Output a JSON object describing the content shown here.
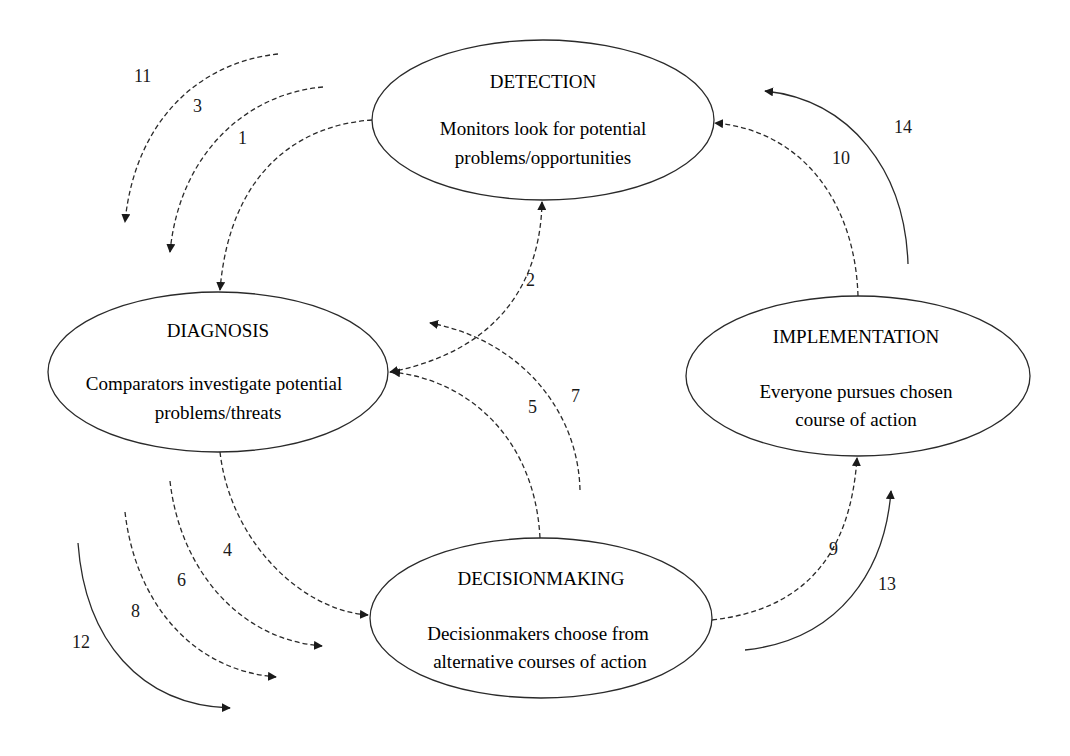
{
  "diagram": {
    "nodes": [
      {
        "id": "detection",
        "title": "DETECTION",
        "desc_line1": "Monitors look for potential",
        "desc_line2": "problems/opportunities"
      },
      {
        "id": "diagnosis",
        "title": "DIAGNOSIS",
        "desc_line1": "Comparators investigate potential",
        "desc_line2": "problems/threats"
      },
      {
        "id": "implementation",
        "title": "IMPLEMENTATION",
        "desc_line1": "Everyone pursues chosen",
        "desc_line2": "course of action"
      },
      {
        "id": "decisionmaking",
        "title": "DECISIONMAKING",
        "desc_line1": "Decisionmakers choose from",
        "desc_line2": "alternative courses of action"
      }
    ],
    "edges": [
      {
        "label": "1",
        "from": "detection",
        "to": "diagnosis",
        "style": "dashed"
      },
      {
        "label": "2",
        "from": "diagnosis",
        "to": "detection",
        "style": "dashed",
        "bidirectional": true
      },
      {
        "label": "3",
        "style": "dashed"
      },
      {
        "label": "4",
        "from": "diagnosis",
        "to": "decisionmaking",
        "style": "dashed"
      },
      {
        "label": "5",
        "from": "decisionmaking",
        "to": "diagnosis",
        "style": "dashed"
      },
      {
        "label": "6",
        "style": "dashed"
      },
      {
        "label": "7",
        "style": "dashed"
      },
      {
        "label": "8",
        "style": "dashed"
      },
      {
        "label": "9",
        "from": "decisionmaking",
        "to": "implementation",
        "style": "dashed"
      },
      {
        "label": "10",
        "from": "implementation",
        "to": "detection",
        "style": "dashed"
      },
      {
        "label": "11",
        "style": "dashed"
      },
      {
        "label": "12",
        "style": "solid"
      },
      {
        "label": "13",
        "style": "solid"
      },
      {
        "label": "14",
        "style": "solid"
      }
    ]
  },
  "colors": {
    "stroke": "#2a2a2a",
    "background": "#ffffff",
    "text": "#1a1a1a"
  }
}
